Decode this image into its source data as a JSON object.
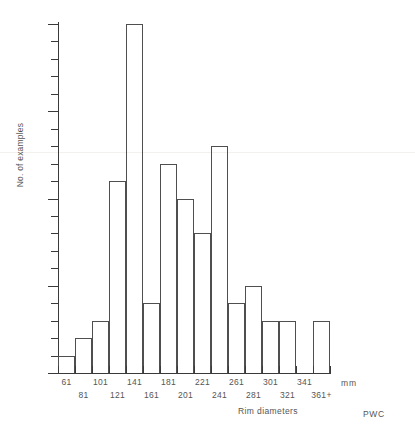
{
  "chart_data": {
    "type": "bar",
    "title": "Rim diameter chart",
    "xlabel": "Rim diameters",
    "ylabel": "No. of examples",
    "xunit": "mm",
    "credit": "PWC",
    "ylim": [
      0,
      20
    ],
    "ytick_step_major": 5,
    "ytick_step_minor": 1,
    "grid": false,
    "legend": null,
    "categories": [
      "61",
      "81",
      "101",
      "121",
      "141",
      "161",
      "181",
      "201",
      "221",
      "241",
      "261",
      "281",
      "301",
      "321",
      "341",
      "361+"
    ],
    "values": [
      1,
      2,
      3,
      11,
      20,
      4,
      12,
      10,
      8,
      13,
      4,
      5,
      3,
      3,
      0,
      3
    ],
    "ytick_labels": [
      "0",
      "5",
      "10",
      "15",
      "20"
    ],
    "ytick_values": [
      0,
      5,
      10,
      15,
      20
    ],
    "xlabels_row1": [
      "61",
      "101",
      "141",
      "181",
      "221",
      "261",
      "301",
      "341"
    ],
    "xlabels_row2": [
      "81",
      "121",
      "161",
      "201",
      "241",
      "281",
      "321",
      "361+"
    ]
  },
  "axes": {
    "y_title": "No. of examples",
    "x_title": "Rim diameters",
    "x_unit": "mm"
  },
  "footer": {
    "credit": "PWC"
  },
  "header": {
    "title": "Rim diameter chart"
  }
}
